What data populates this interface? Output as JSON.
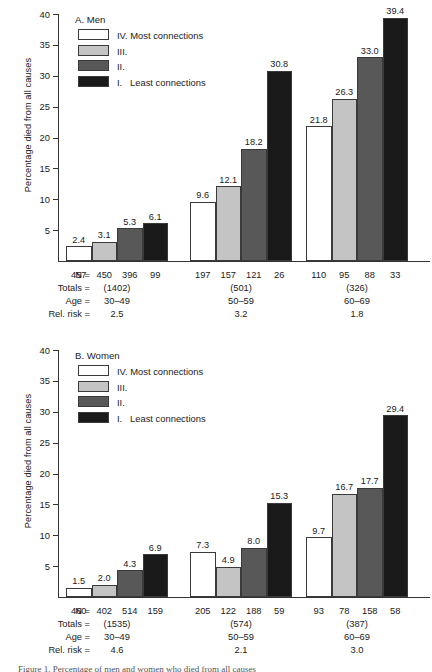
{
  "figure": {
    "caption_partial": "Figure 1.  Percentage of men and women who died from all causes",
    "ylabel": "Percentage died from all causes",
    "y_ticks": [
      5,
      10,
      15,
      20,
      25,
      30,
      35,
      40
    ],
    "ylim": [
      0,
      40
    ],
    "legend": [
      {
        "key": "IV",
        "label": "IV. Most connections",
        "color": "#ffffff"
      },
      {
        "key": "III",
        "label": "III.",
        "color": "#c4c4c4"
      },
      {
        "key": "II",
        "label": "II.",
        "color": "#585858"
      },
      {
        "key": "I",
        "label": "I.   Least connections",
        "color": "#1a1a1a"
      }
    ],
    "row_labels": {
      "n": "N =",
      "totals": "Totals =",
      "age": "Age =",
      "rel_risk": "Rel. risk ="
    }
  },
  "chart_data": [
    {
      "type": "bar",
      "title": "A. Men",
      "ylabel": "Percentage died from all causes",
      "xlabel": "",
      "ylim": [
        0,
        40
      ],
      "yticks": [
        5,
        10,
        15,
        20,
        25,
        30,
        35,
        40
      ],
      "grid": false,
      "legend_position": "top-left",
      "categories": [
        "30–49",
        "50–59",
        "60–69"
      ],
      "series": [
        {
          "name": "IV. Most connections",
          "values": [
            2.4,
            9.6,
            21.8
          ]
        },
        {
          "name": "III.",
          "values": [
            3.1,
            12.1,
            26.3
          ]
        },
        {
          "name": "II.",
          "values": [
            5.3,
            18.2,
            33.0
          ]
        },
        {
          "name": "I. Least connections",
          "values": [
            6.1,
            30.8,
            39.4
          ]
        }
      ],
      "groups": [
        {
          "age": "30–49",
          "n": [
            "457",
            "450",
            "396",
            "99"
          ],
          "total": "(1402)",
          "rel_risk": "2.5",
          "values": [
            2.4,
            3.1,
            5.3,
            6.1
          ],
          "labels": [
            "2.4",
            "3.1",
            "5.3",
            "6.1"
          ]
        },
        {
          "age": "50–59",
          "n": [
            "197",
            "157",
            "121",
            "26"
          ],
          "total": "(501)",
          "rel_risk": "3.2",
          "values": [
            9.6,
            12.1,
            18.2,
            30.8
          ],
          "labels": [
            "9.6",
            "12.1",
            "18.2",
            "30.8"
          ]
        },
        {
          "age": "60–69",
          "n": [
            "110",
            "95",
            "88",
            "33"
          ],
          "total": "(326)",
          "rel_risk": "1.8",
          "values": [
            21.8,
            26.3,
            33.0,
            39.4
          ],
          "labels": [
            "21.8",
            "26.3",
            "33.0",
            "39.4"
          ]
        }
      ]
    },
    {
      "type": "bar",
      "title": "B. Women",
      "ylabel": "Percentage died from all causes",
      "xlabel": "",
      "ylim": [
        0,
        40
      ],
      "yticks": [
        5,
        10,
        15,
        20,
        25,
        30,
        35,
        40
      ],
      "grid": false,
      "legend_position": "top-left",
      "categories": [
        "30–49",
        "50–59",
        "60–69"
      ],
      "series": [
        {
          "name": "IV. Most connections",
          "values": [
            1.5,
            7.3,
            9.7
          ]
        },
        {
          "name": "III.",
          "values": [
            2.0,
            4.9,
            16.7
          ]
        },
        {
          "name": "II.",
          "values": [
            4.3,
            8.0,
            17.7
          ]
        },
        {
          "name": "I. Least connections",
          "values": [
            6.9,
            15.3,
            29.4
          ]
        }
      ],
      "groups": [
        {
          "age": "30–49",
          "n": [
            "460",
            "402",
            "514",
            "159"
          ],
          "total": "(1535)",
          "rel_risk": "4.6",
          "values": [
            1.5,
            2.0,
            4.3,
            6.9
          ],
          "labels": [
            "1.5",
            "2.0",
            "4.3",
            "6.9"
          ]
        },
        {
          "age": "50–59",
          "n": [
            "205",
            "122",
            "188",
            "59"
          ],
          "total": "(574)",
          "rel_risk": "2.1",
          "values": [
            7.3,
            4.9,
            8.0,
            15.3
          ],
          "labels": [
            "7.3",
            "4.9",
            "8.0",
            "15.3"
          ]
        },
        {
          "age": "60–69",
          "n": [
            "93",
            "78",
            "158",
            "58"
          ],
          "total": "(387)",
          "rel_risk": "3.0",
          "values": [
            9.7,
            16.7,
            17.7,
            29.4
          ],
          "labels": [
            "9.7",
            "16.7",
            "17.7",
            "29.4"
          ]
        }
      ]
    }
  ]
}
